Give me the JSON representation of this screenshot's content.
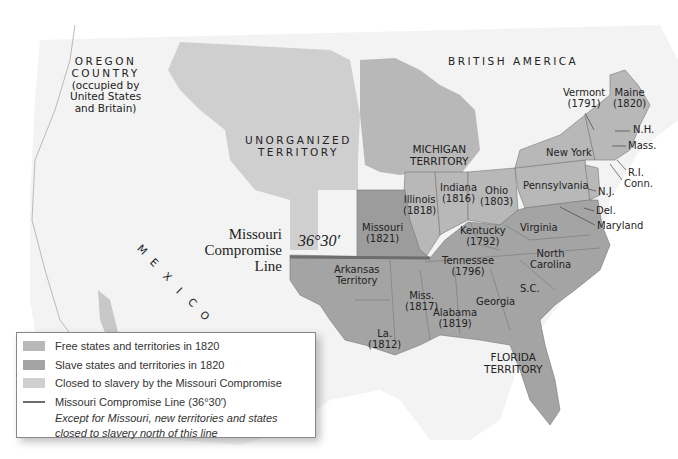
{
  "map": {
    "colors": {
      "free": "#b8b8b8",
      "slave": "#a4a4a4",
      "closed": "#cfcfcf",
      "missouri": "#9c9c9c",
      "foreign": "#f2f2f2",
      "water": "#ffffff",
      "line": "#6e6e6e"
    },
    "regions": {
      "oregon": [
        "OREGON",
        "COUNTRY",
        "(occupied by",
        "United States",
        "and Britain)"
      ],
      "british_america": "BRITISH AMERICA",
      "unorganized": [
        "UNORGANIZED",
        "TERRITORY"
      ],
      "mexico": [
        "M",
        "E",
        "X",
        "I",
        "C",
        "O"
      ],
      "michigan": [
        "MICHIGAN",
        "TERRITORY"
      ],
      "florida": [
        "FLORIDA",
        "TERRITORY"
      ],
      "arkansas": [
        "Arkansas",
        "Territory"
      ]
    },
    "compromise_line": {
      "title": [
        "Missouri",
        "Compromise",
        "Line"
      ],
      "latitude": "36°30′"
    },
    "states": [
      {
        "name": "Vermont",
        "year": "(1791)"
      },
      {
        "name": "Maine",
        "year": "(1820)"
      },
      {
        "name": "N.H.",
        "year": ""
      },
      {
        "name": "Mass.",
        "year": ""
      },
      {
        "name": "R.I.",
        "year": ""
      },
      {
        "name": "Conn.",
        "year": ""
      },
      {
        "name": "New York",
        "year": ""
      },
      {
        "name": "N.J.",
        "year": ""
      },
      {
        "name": "Pennsylvania",
        "year": ""
      },
      {
        "name": "Del.",
        "year": ""
      },
      {
        "name": "Maryland",
        "year": ""
      },
      {
        "name": "Ohio",
        "year": "(1803)"
      },
      {
        "name": "Indiana",
        "year": "(1816)"
      },
      {
        "name": "Illinois",
        "year": "(1818)"
      },
      {
        "name": "Missouri",
        "year": "(1821)"
      },
      {
        "name": "Kentucky",
        "year": "(1792)"
      },
      {
        "name": "Virginia",
        "year": ""
      },
      {
        "name": "Tennessee",
        "year": "(1796)"
      },
      {
        "name": "North",
        "year": "Carolina"
      },
      {
        "name": "S.C.",
        "year": ""
      },
      {
        "name": "Georgia",
        "year": ""
      },
      {
        "name": "Alabama",
        "year": "(1819)"
      },
      {
        "name": "Miss.",
        "year": "(1817)"
      },
      {
        "name": "La.",
        "year": "(1812)"
      }
    ]
  },
  "legend": {
    "items": [
      {
        "label": "Free states and territories in 1820",
        "color": "#b8b8b8"
      },
      {
        "label": "Slave states and territories in 1820",
        "color": "#a4a4a4"
      },
      {
        "label": "Closed to slavery by the Missouri Compromise",
        "color": "#cfcfcf"
      },
      {
        "label": "Missouri Compromise Line (36°30′)",
        "color": "#6e6e6e"
      }
    ],
    "note": [
      "Except for Missouri, new territories and states",
      "closed to slavery north of this line"
    ]
  }
}
